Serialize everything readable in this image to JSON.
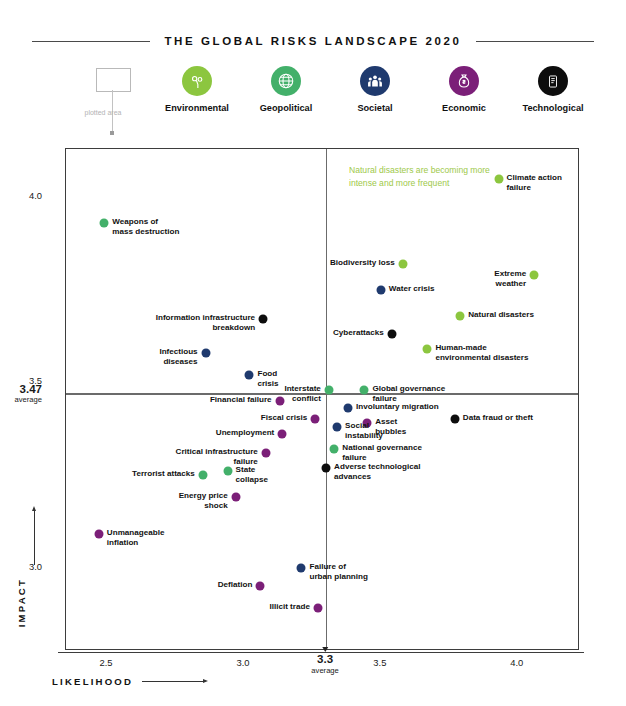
{
  "header": {
    "title": "THE GLOBAL RISKS LANDSCAPE 2020"
  },
  "callout": {
    "label": "plotted\narea"
  },
  "legend": {
    "items": [
      {
        "label": "Environmental",
        "color": "#8CC63F",
        "icon": "leaf-icon"
      },
      {
        "label": "Geopolitical",
        "color": "#43B06A",
        "icon": "globe-icon"
      },
      {
        "label": "Societal",
        "color": "#1F3A6E",
        "icon": "people-icon"
      },
      {
        "label": "Economic",
        "color": "#7B1F78",
        "icon": "money-bag-icon"
      },
      {
        "label": "Technological",
        "color": "#0D0D0D",
        "icon": "device-icon"
      }
    ]
  },
  "annotation": {
    "text": "Natural disasters are becoming more intense and more frequent",
    "color": "#9ec94a"
  },
  "chart_data": {
    "type": "scatter",
    "title": "THE GLOBAL RISKS LANDSCAPE 2020",
    "xlabel": "LIKELIHOOD",
    "ylabel": "IMPACT",
    "xlim": [
      2.35,
      4.22
    ],
    "ylim": [
      2.78,
      4.13
    ],
    "xticks": [
      "2.5",
      "3.0",
      "3.5",
      "4.0"
    ],
    "xtick_values": [
      2.5,
      3.0,
      3.5,
      4.0
    ],
    "yticks": [
      "4.0",
      "3.5",
      "3.0"
    ],
    "ytick_values": [
      4.0,
      3.5,
      3.0
    ],
    "x_average": {
      "value": 3.3,
      "label": "3.3",
      "caption": "average"
    },
    "y_average": {
      "value": 3.47,
      "label": "3.47",
      "caption": "average"
    },
    "grid": false,
    "legend_position": "top",
    "categories": [
      "Environmental",
      "Geopolitical",
      "Societal",
      "Economic",
      "Technological"
    ],
    "category_colors": {
      "Environmental": "#8CC63F",
      "Geopolitical": "#43B06A",
      "Societal": "#1F3A6E",
      "Economic": "#7B1F78",
      "Technological": "#0D0D0D"
    },
    "points": [
      {
        "name": "Climate action failure",
        "x": 3.93,
        "y": 4.05,
        "category": "Environmental",
        "label": "Climate action\nfailure",
        "side": "right"
      },
      {
        "name": "Weapons of mass destruction",
        "x": 2.49,
        "y": 3.93,
        "category": "Geopolitical",
        "label": "Weapons of\nmass destruction",
        "side": "right"
      },
      {
        "name": "Biodiversity loss",
        "x": 3.58,
        "y": 3.82,
        "category": "Environmental",
        "label": "Biodiversity loss",
        "side": "left"
      },
      {
        "name": "Extreme weather",
        "x": 4.06,
        "y": 3.79,
        "category": "Environmental",
        "label": "Extreme\nweather",
        "side": "left"
      },
      {
        "name": "Water crisis",
        "x": 3.5,
        "y": 3.75,
        "category": "Societal",
        "label": "Water crisis",
        "side": "right"
      },
      {
        "name": "Natural disasters",
        "x": 3.79,
        "y": 3.68,
        "category": "Environmental",
        "label": "Natural disasters",
        "side": "right"
      },
      {
        "name": "Information infrastructure breakdown",
        "x": 3.07,
        "y": 3.67,
        "category": "Technological",
        "label": "Information infrastructure\nbreakdown",
        "side": "left"
      },
      {
        "name": "Cyberattacks",
        "x": 3.54,
        "y": 3.63,
        "category": "Technological",
        "label": "Cyberattacks",
        "side": "left"
      },
      {
        "name": "Human-made environmental disasters",
        "x": 3.67,
        "y": 3.59,
        "category": "Environmental",
        "label": "Human-made\nenvironmental disasters",
        "side": "right"
      },
      {
        "name": "Infectious diseases",
        "x": 2.86,
        "y": 3.58,
        "category": "Societal",
        "label": "Infectious\ndiseases",
        "side": "left"
      },
      {
        "name": "Food crisis",
        "x": 3.02,
        "y": 3.52,
        "category": "Societal",
        "label": "Food\ncrisis",
        "side": "right"
      },
      {
        "name": "Interstate conflict",
        "x": 3.31,
        "y": 3.48,
        "category": "Geopolitical",
        "label": "Interstate\nconflict",
        "side": "left"
      },
      {
        "name": "Global governance failure",
        "x": 3.44,
        "y": 3.48,
        "category": "Geopolitical",
        "label": "Global governance\nfailure",
        "side": "right"
      },
      {
        "name": "Financial failure",
        "x": 3.13,
        "y": 3.45,
        "category": "Economic",
        "label": "Financial failure",
        "side": "left"
      },
      {
        "name": "Involuntary migration",
        "x": 3.38,
        "y": 3.43,
        "category": "Societal",
        "label": "Involuntary migration",
        "side": "right"
      },
      {
        "name": "Data fraud or theft",
        "x": 3.77,
        "y": 3.4,
        "category": "Technological",
        "label": "Data fraud or theft",
        "side": "right"
      },
      {
        "name": "Fiscal crisis",
        "x": 3.26,
        "y": 3.4,
        "category": "Economic",
        "label": "Fiscal crisis",
        "side": "left"
      },
      {
        "name": "Asset bubbles",
        "x": 3.45,
        "y": 3.39,
        "category": "Economic",
        "label": "Asset\nbubbles",
        "side": "right"
      },
      {
        "name": "Social instability",
        "x": 3.34,
        "y": 3.38,
        "category": "Societal",
        "label": "Social\ninstability",
        "side": "right"
      },
      {
        "name": "Unemployment",
        "x": 3.14,
        "y": 3.36,
        "category": "Economic",
        "label": "Unemployment",
        "side": "left"
      },
      {
        "name": "National governance failure",
        "x": 3.33,
        "y": 3.32,
        "category": "Geopolitical",
        "label": "National governance\nfailure",
        "side": "right"
      },
      {
        "name": "Critical infrastructure failure",
        "x": 3.08,
        "y": 3.31,
        "category": "Economic",
        "label": "Critical infrastructure\nfailure",
        "side": "left"
      },
      {
        "name": "Adverse technological advances",
        "x": 3.3,
        "y": 3.27,
        "category": "Technological",
        "label": "Adverse technological\nadvances",
        "side": "right"
      },
      {
        "name": "State collapse",
        "x": 2.94,
        "y": 3.26,
        "category": "Geopolitical",
        "label": "State\ncollapse",
        "side": "right"
      },
      {
        "name": "Terrorist attacks",
        "x": 2.85,
        "y": 3.25,
        "category": "Geopolitical",
        "label": "Terrorist attacks",
        "side": "left"
      },
      {
        "name": "Energy price shock",
        "x": 2.97,
        "y": 3.19,
        "category": "Economic",
        "label": "Energy price\nshock",
        "side": "left"
      },
      {
        "name": "Unmanageable inflation",
        "x": 2.47,
        "y": 3.09,
        "category": "Economic",
        "label": "Unmanageable\ninflation",
        "side": "right"
      },
      {
        "name": "Failure of urban planning",
        "x": 3.21,
        "y": 3.0,
        "category": "Societal",
        "label": "Failure of\nurban planning",
        "side": "right"
      },
      {
        "name": "Deflation",
        "x": 3.06,
        "y": 2.95,
        "category": "Economic",
        "label": "Deflation",
        "side": "left"
      },
      {
        "name": "Illicit trade",
        "x": 3.27,
        "y": 2.89,
        "category": "Economic",
        "label": "Illicit trade",
        "side": "left"
      }
    ]
  }
}
